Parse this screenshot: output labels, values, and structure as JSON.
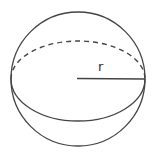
{
  "diagram": {
    "shape": "sphere",
    "labels": {
      "radius": "r"
    },
    "colors": {
      "stroke": "#444444",
      "background": "#ffffff"
    }
  }
}
